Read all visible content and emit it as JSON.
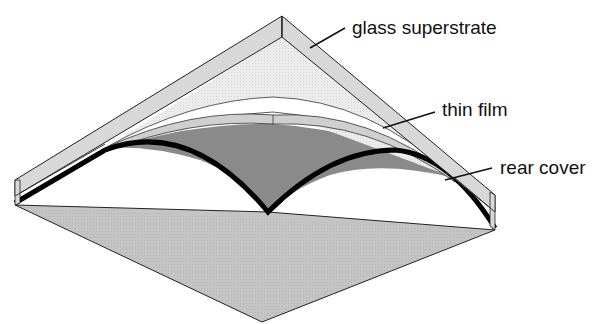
{
  "diagram": {
    "type": "cross-section illustration",
    "colors": {
      "background": "#ffffff",
      "glass": "#d8d8d8",
      "glass_inner": "#ececec",
      "thin_film": "#cfcfcf",
      "rear_cover_top": "#8a8a8a",
      "base": "#c4c4c4",
      "outline": "#111111"
    },
    "labels": [
      {
        "text": "glass superstrate",
        "x": 352,
        "y": 34
      },
      {
        "text": "thin film",
        "x": 442,
        "y": 116
      },
      {
        "text": "rear cover",
        "x": 500,
        "y": 174
      }
    ]
  }
}
